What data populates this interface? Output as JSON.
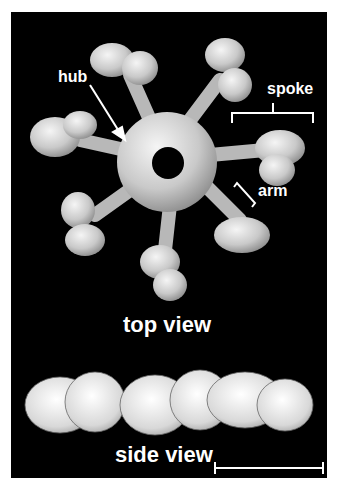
{
  "figure": {
    "labels": {
      "hub": "hub",
      "spoke": "spoke",
      "arm": "arm",
      "top_view": "top view",
      "side_view": "side view"
    },
    "colors": {
      "background": "#000000",
      "density": "#d9d9d9",
      "text": "#ffffff"
    }
  }
}
